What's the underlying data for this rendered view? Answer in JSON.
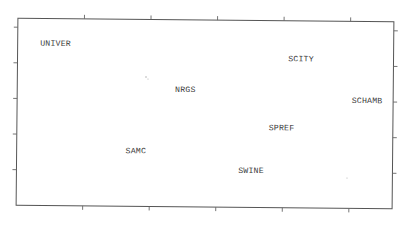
{
  "chart_data": {
    "type": "scatter",
    "title": "",
    "xlabel": "",
    "ylabel": "",
    "grid": false,
    "legend": null,
    "axis_tick_labels": false,
    "x_ticks_count": 5,
    "y_ticks_count": 5,
    "points": [
      {
        "label": "UNIVER",
        "x": 0.06,
        "y": 0.87
      },
      {
        "label": "NRGS",
        "x": 0.42,
        "y": 0.63
      },
      {
        "label": "SCITY",
        "x": 0.72,
        "y": 0.8
      },
      {
        "label": "SCHAMB",
        "x": 0.89,
        "y": 0.58
      },
      {
        "label": "SPREF",
        "x": 0.67,
        "y": 0.43
      },
      {
        "label": "SAMC",
        "x": 0.29,
        "y": 0.3
      },
      {
        "label": "SWINE",
        "x": 0.59,
        "y": 0.2
      }
    ],
    "frame": {
      "left": 17,
      "top": 20,
      "right": 393,
      "bottom": 207
    },
    "colors": {
      "frame": "#555555",
      "text": "#3a3a3a",
      "background": "#ffffff"
    }
  }
}
